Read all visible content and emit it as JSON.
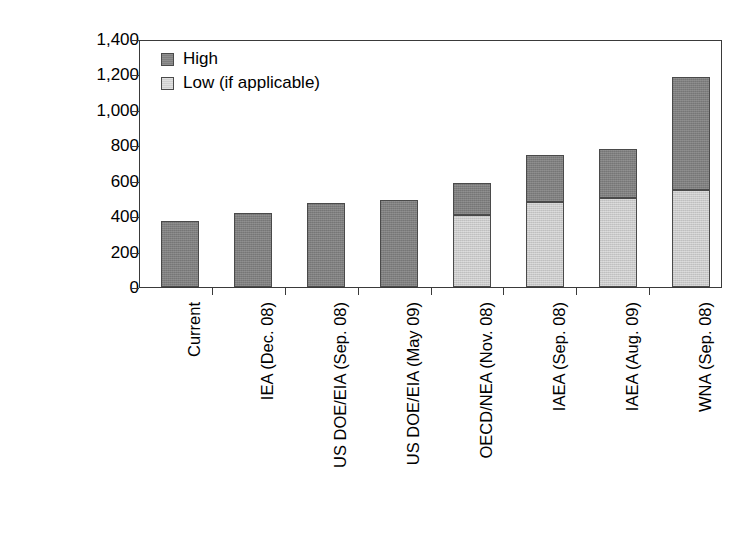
{
  "chart_data": {
    "type": "bar",
    "title": "",
    "subtitle": "",
    "xlabel": "",
    "ylabel": "Total capacity (GWe)",
    "ylim": [
      0,
      1400
    ],
    "yticks": [
      "0",
      "200",
      "400",
      "600",
      "800",
      "1,000",
      "1,200",
      "1,400"
    ],
    "ytick_values": [
      0,
      200,
      400,
      600,
      800,
      1000,
      1200,
      1400
    ],
    "grid": false,
    "stacked": true,
    "legend_position": "top-left",
    "legend": [
      {
        "label": "High",
        "color": "#7f7f7f"
      },
      {
        "label": "Low (if applicable)",
        "color": "#c9c9c9"
      }
    ],
    "categories": [
      "Current",
      "IEA (Dec. 08)",
      "US DOE/EIA (Sep. 08)",
      "US DOE/EIA (May 09)",
      "OECD/NEA (Nov. 08)",
      "IAEA (Sep. 08)",
      "IAEA (Aug. 09)",
      "WNA (Sep. 08)"
    ],
    "series": [
      {
        "name": "Low (if applicable)",
        "values": [
          null,
          null,
          null,
          null,
          405,
          480,
          505,
          550
        ]
      },
      {
        "name": "High",
        "values": [
          370,
          420,
          475,
          490,
          590,
          745,
          780,
          1185
        ]
      }
    ]
  }
}
